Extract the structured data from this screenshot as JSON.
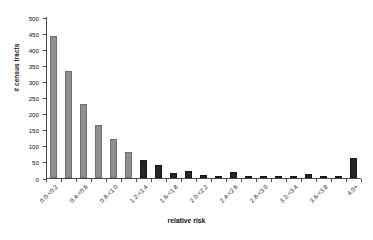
{
  "chart_data": {
    "type": "bar",
    "title": "",
    "xlabel": "relative risk",
    "ylabel": "# census tracts",
    "ylim": [
      0,
      500
    ],
    "yticks": [
      0,
      50,
      100,
      150,
      200,
      250,
      300,
      350,
      400,
      450,
      500
    ],
    "grid": false,
    "legend": "none",
    "categories": [
      "0.0-<0.2",
      "0.2-<0.4",
      "0.4-<0.6",
      "0.6-<0.8",
      "0.8-<1.0",
      "1.0-<1.2",
      "1.2-<1.4",
      "1.4-<1.6",
      "1.6-<1.8",
      "1.8-<2.0",
      "2.0-<2.2",
      "2.2-<2.4",
      "2.4-<2.6",
      "2.6-<2.8",
      "2.8-<3.0",
      "3.0-<3.2",
      "3.2-<3.4",
      "3.4-<3.6",
      "3.6-<3.8",
      "3.8-<4.0",
      "4.0+"
    ],
    "visible_tick_labels": [
      "0.0-<0.2",
      "0.4-<0.6",
      "0.8-<1.0",
      "1.2-<1.4",
      "1.6-<1.8",
      "2.0-<2.2",
      "2.4-<2.6",
      "2.8-<3.0",
      "3.2-<3.4",
      "3.6-<3.8",
      "4.0+"
    ],
    "values": [
      440,
      332,
      230,
      165,
      120,
      80,
      55,
      40,
      15,
      22,
      8,
      5,
      18,
      6,
      7,
      6,
      4,
      12,
      5,
      4,
      62
    ],
    "colors": {
      "light_bar": "#8f8f8f",
      "dark_bar": "#262626",
      "axis": "#4a4a4a",
      "text": "#111111",
      "background": "#ffffff"
    },
    "bar_styles": [
      "light",
      "light",
      "light",
      "light",
      "light",
      "light",
      "dark",
      "dark",
      "dark",
      "dark",
      "dark",
      "dark",
      "dark",
      "dark",
      "dark",
      "dark",
      "dark",
      "dark",
      "dark",
      "dark",
      "dark"
    ]
  }
}
